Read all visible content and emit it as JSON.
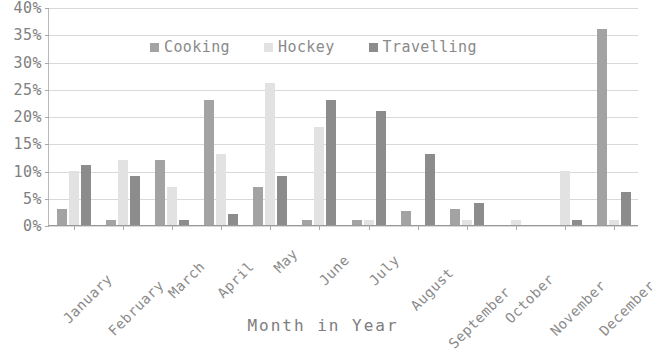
{
  "chart_data": {
    "type": "bar",
    "title": "",
    "xlabel": "Month in Year",
    "ylabel": "",
    "ylim": [
      0,
      40
    ],
    "ytick_labels": [
      "40%",
      "35%",
      "30%",
      "25%",
      "20%",
      "15%",
      "10%",
      "5%",
      "0%"
    ],
    "ytick_values": [
      40,
      35,
      30,
      25,
      20,
      15,
      10,
      5,
      0
    ],
    "grid": true,
    "legend_position": "top-center",
    "categories": [
      "January",
      "February",
      "March",
      "April",
      "May",
      "June",
      "July",
      "August",
      "September",
      "October",
      "November",
      "December"
    ],
    "series": [
      {
        "name": "Cooking",
        "color": "#a3a3a3",
        "values": [
          3,
          1,
          12,
          23,
          7,
          1,
          1,
          2.5,
          3,
          0,
          0,
          36
        ]
      },
      {
        "name": "Hockey",
        "color": "#e2e2e2",
        "values": [
          10,
          12,
          7,
          13,
          26,
          18,
          1,
          0,
          1,
          1,
          10,
          1
        ]
      },
      {
        "name": "Travelling",
        "color": "#8c8c8c",
        "values": [
          11,
          9,
          1,
          2,
          9,
          23,
          21,
          13,
          4,
          0,
          1,
          6
        ]
      }
    ]
  },
  "axis": {
    "x_title": "Month in Year"
  },
  "legend": {
    "entries": [
      {
        "label": "Cooking",
        "swatch": "legend-swatch-cooking"
      },
      {
        "label": "Hockey",
        "swatch": "legend-swatch-hockey"
      },
      {
        "label": "Travelling",
        "swatch": "legend-swatch-travelling"
      }
    ]
  }
}
